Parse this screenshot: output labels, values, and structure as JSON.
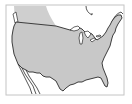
{
  "map": {
    "subject": "Contiguous United States",
    "highlighted_region": "United States (lower 48)",
    "secondary_shaded_region": "Western Canada",
    "labels": []
  },
  "colors": {
    "background": "#ffffff",
    "frame": "#c4c4c4",
    "land_fill": "#c8c8c8",
    "canada_fill": "#cfcfcf",
    "outline": "#2a2a2a",
    "water": "#ffffff"
  }
}
